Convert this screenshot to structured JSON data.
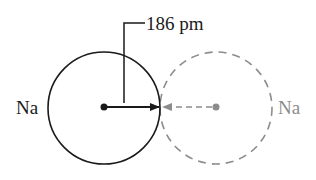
{
  "diagram": {
    "left_atom": {
      "label": "Na",
      "style": "solid",
      "color": "#1a1a1a"
    },
    "right_atom": {
      "label": "Na",
      "style": "dashed",
      "color": "#8c8c8c"
    },
    "radius_label": "186 pm"
  }
}
